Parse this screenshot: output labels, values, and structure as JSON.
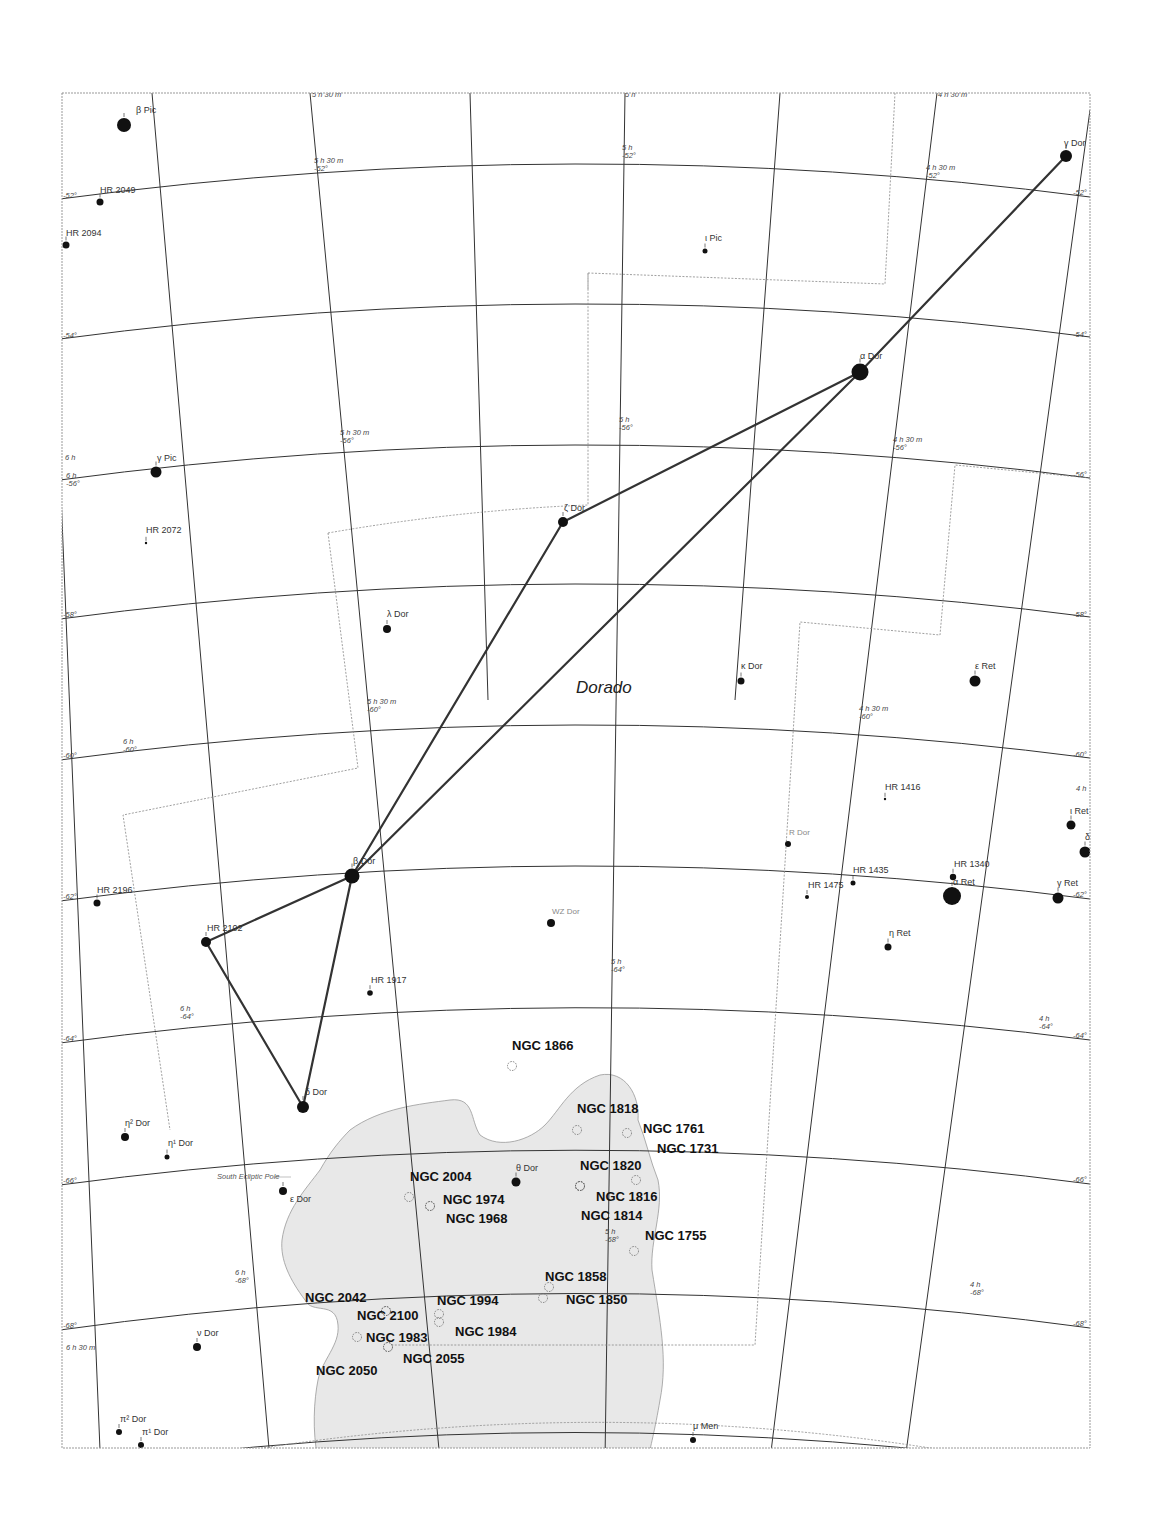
{
  "map": {
    "constellation": "Dorado",
    "special_label": "South Ecliptic Pole",
    "ra_labels": [
      {
        "text": "5 h 30 m",
        "x": 312,
        "y": 97
      },
      {
        "text": "5 h",
        "x": 625,
        "y": 97
      },
      {
        "text": "4 h 30 m",
        "x": 938,
        "y": 97
      },
      {
        "text": "6 h",
        "x": 65,
        "y": 460
      },
      {
        "text": "6 h 30 m",
        "x": 66,
        "y": 1350
      },
      {
        "text": "4 h",
        "x": 1076,
        "y": 791
      }
    ],
    "grid_labels": [
      {
        "ra": "5 h 30 m",
        "dec": "-52°",
        "x": 314,
        "y": 163
      },
      {
        "ra": "5 h",
        "dec": "-52°",
        "x": 622,
        "y": 150
      },
      {
        "ra": "4 h 30 m",
        "dec": "-52°",
        "x": 926,
        "y": 170
      },
      {
        "ra": "5 h 30 m",
        "dec": "-56°",
        "x": 340,
        "y": 435
      },
      {
        "ra": "5 h",
        "dec": "-56°",
        "x": 619,
        "y": 422
      },
      {
        "ra": "4 h 30 m",
        "dec": "-56°",
        "x": 893,
        "y": 442
      },
      {
        "ra": "6 h",
        "dec": "-56°",
        "x": 66,
        "y": 478
      },
      {
        "ra": "5 h 30 m",
        "dec": "-60°",
        "x": 367,
        "y": 704
      },
      {
        "ra": "4 h 30 m",
        "dec": "-60°",
        "x": 859,
        "y": 711
      },
      {
        "ra": "6 h",
        "dec": "-60°",
        "x": 123,
        "y": 744
      },
      {
        "ra": "6 h",
        "dec": "-64°",
        "x": 180,
        "y": 1011
      },
      {
        "ra": "5 h",
        "dec": "-64°",
        "x": 611,
        "y": 964
      },
      {
        "ra": "4 h",
        "dec": "-64°",
        "x": 1039,
        "y": 1021
      },
      {
        "ra": "5 h",
        "dec": "-68°",
        "x": 605,
        "y": 1234
      },
      {
        "ra": "6 h",
        "dec": "-68°",
        "x": 235,
        "y": 1275
      },
      {
        "ra": "4 h",
        "dec": "-68°",
        "x": 970,
        "y": 1287
      }
    ],
    "edge_dec_labels": [
      {
        "text": "-52°",
        "x": 63,
        "y": 198
      },
      {
        "text": "-54°",
        "x": 63,
        "y": 338
      },
      {
        "text": "-58°",
        "x": 63,
        "y": 617
      },
      {
        "text": "-60°",
        "x": 63,
        "y": 758
      },
      {
        "text": "-62°",
        "x": 63,
        "y": 899
      },
      {
        "text": "-64°",
        "x": 63,
        "y": 1041
      },
      {
        "text": "-66°",
        "x": 63,
        "y": 1183
      },
      {
        "text": "-68°",
        "x": 63,
        "y": 1328
      },
      {
        "text": "-52°",
        "x": 1073,
        "y": 195
      },
      {
        "text": "-54°",
        "x": 1073,
        "y": 337
      },
      {
        "text": "-56°",
        "x": 1073,
        "y": 477
      },
      {
        "text": "-58°",
        "x": 1073,
        "y": 617
      },
      {
        "text": "-60°",
        "x": 1073,
        "y": 757
      },
      {
        "text": "-62°",
        "x": 1073,
        "y": 897
      },
      {
        "text": "-64°",
        "x": 1073,
        "y": 1038
      },
      {
        "text": "-66°",
        "x": 1073,
        "y": 1182
      },
      {
        "text": "-68°",
        "x": 1073,
        "y": 1326
      }
    ],
    "stars": [
      {
        "name": "β Pic",
        "x": 124,
        "y": 125,
        "r": 7,
        "lx": 136,
        "ly": 113
      },
      {
        "name": "HR 2049",
        "x": 100,
        "y": 202,
        "r": 3.5,
        "lx": 100,
        "ly": 193
      },
      {
        "name": "HR 2094",
        "x": 66,
        "y": 245,
        "r": 3.5,
        "lx": 66,
        "ly": 236
      },
      {
        "name": "γ Dor",
        "x": 1066,
        "y": 156,
        "r": 6,
        "lx": 1064,
        "ly": 146
      },
      {
        "name": "ι Pic",
        "x": 705,
        "y": 251,
        "r": 2.5,
        "lx": 705,
        "ly": 241
      },
      {
        "name": "α Dor",
        "x": 860,
        "y": 372,
        "r": 8.5,
        "lx": 860,
        "ly": 359
      },
      {
        "name": "γ Pic",
        "x": 156,
        "y": 472,
        "r": 5.5,
        "lx": 157,
        "ly": 461
      },
      {
        "name": "HR 2072",
        "x": 146,
        "y": 543,
        "r": 1.2,
        "lx": 146,
        "ly": 533
      },
      {
        "name": "ζ Dor",
        "x": 563,
        "y": 522,
        "r": 5,
        "lx": 564,
        "ly": 511
      },
      {
        "name": "λ Dor",
        "x": 387,
        "y": 629,
        "r": 4,
        "lx": 387,
        "ly": 617
      },
      {
        "name": "κ Dor",
        "x": 741,
        "y": 681,
        "r": 3.5,
        "lx": 741,
        "ly": 669
      },
      {
        "name": "ε Ret",
        "x": 975,
        "y": 681,
        "r": 5.5,
        "lx": 975,
        "ly": 669
      },
      {
        "name": "HR 1416",
        "x": 885,
        "y": 799,
        "r": 1.2,
        "lx": 885,
        "ly": 790
      },
      {
        "name": "ι Ret",
        "x": 1071,
        "y": 825,
        "r": 4.5,
        "lx": 1070,
        "ly": 814
      },
      {
        "name": "δ Ret",
        "x": 1085,
        "y": 852,
        "r": 5.5,
        "lx": 1085,
        "ly": 840
      },
      {
        "name": "HR 1340",
        "x": 953,
        "y": 877,
        "r": 3.2,
        "lx": 954,
        "ly": 867
      },
      {
        "name": "α Ret",
        "x": 952,
        "y": 896,
        "r": 9,
        "lx": 953,
        "ly": 885
      },
      {
        "name": "HR 1435",
        "x": 853,
        "y": 883,
        "r": 2.5,
        "lx": 853,
        "ly": 873
      },
      {
        "name": "HR 1475",
        "x": 807,
        "y": 897,
        "r": 2,
        "lx": 808,
        "ly": 888
      },
      {
        "name": "γ Ret",
        "x": 1058,
        "y": 898,
        "r": 5.5,
        "lx": 1057,
        "ly": 886
      },
      {
        "name": "η Ret",
        "x": 888,
        "y": 947,
        "r": 3.5,
        "lx": 889,
        "ly": 936
      },
      {
        "name": "β Dor",
        "x": 352,
        "y": 876,
        "r": 7.5,
        "lx": 353,
        "ly": 864
      },
      {
        "name": "HR 2196",
        "x": 97,
        "y": 903,
        "r": 3.5,
        "lx": 97,
        "ly": 893
      },
      {
        "name": "HR 2102",
        "x": 206,
        "y": 942,
        "r": 5,
        "lx": 207,
        "ly": 931
      },
      {
        "name": "HR 1917",
        "x": 370,
        "y": 993,
        "r": 2.8,
        "lx": 371,
        "ly": 983
      },
      {
        "name": "δ Dor",
        "x": 303,
        "y": 1107,
        "r": 6,
        "lx": 305,
        "ly": 1095
      },
      {
        "name": "η² Dor",
        "x": 125,
        "y": 1137,
        "r": 4,
        "lx": 125,
        "ly": 1126
      },
      {
        "name": "η¹ Dor",
        "x": 167,
        "y": 1157,
        "r": 2.5,
        "lx": 168,
        "ly": 1146
      },
      {
        "name": "θ Dor",
        "x": 516,
        "y": 1182,
        "r": 4.5,
        "lx": 516,
        "ly": 1171
      },
      {
        "name": "ε Dor",
        "x": 283,
        "y": 1191,
        "r": 4,
        "lx": 290,
        "ly": 1202
      },
      {
        "name": "ν Dor",
        "x": 197,
        "y": 1347,
        "r": 4,
        "lx": 197,
        "ly": 1336
      },
      {
        "name": "π² Dor",
        "x": 119,
        "y": 1432,
        "r": 3,
        "lx": 120,
        "ly": 1422
      },
      {
        "name": "π¹ Dor",
        "x": 141,
        "y": 1445,
        "r": 3,
        "lx": 142,
        "ly": 1435
      },
      {
        "name": "μ Men",
        "x": 693,
        "y": 1440,
        "r": 3,
        "lx": 693,
        "ly": 1429
      }
    ],
    "variable_stars": [
      {
        "name": "R Dor",
        "x": 788,
        "y": 844,
        "r": 3,
        "lx": 789,
        "ly": 835
      },
      {
        "name": "WZ Dor",
        "x": 551,
        "y": 923,
        "r": 4,
        "lx": 552,
        "ly": 914
      }
    ],
    "deep_sky": [
      {
        "name": "NGC 1866",
        "x": 512,
        "y": 1066,
        "lx": 512,
        "ly": 1050
      },
      {
        "name": "NGC 1818",
        "x": 577,
        "y": 1130,
        "lx": 577,
        "ly": 1113
      },
      {
        "name": "NGC 1761",
        "x": 627,
        "y": 1133,
        "lx": 643,
        "ly": 1133
      },
      {
        "name": "NGC 1731",
        "x": 636,
        "y": 1180,
        "lx": 657,
        "ly": 1153
      },
      {
        "name": "NGC 1820",
        "x": 580,
        "y": 1186,
        "lx": 580,
        "ly": 1170
      },
      {
        "name": "NGC 1816",
        "x": 580,
        "y": 1186,
        "lx": 596,
        "ly": 1201
      },
      {
        "name": "NGC 1814",
        "x": 580,
        "y": 1186,
        "lx": 581,
        "ly": 1220
      },
      {
        "name": "NGC 2004",
        "x": 409,
        "y": 1197,
        "lx": 410,
        "ly": 1181
      },
      {
        "name": "NGC 1974",
        "x": 430,
        "y": 1206,
        "lx": 443,
        "ly": 1204
      },
      {
        "name": "NGC 1968",
        "x": 430,
        "y": 1206,
        "lx": 446,
        "ly": 1223
      },
      {
        "name": "NGC 1755",
        "x": 634,
        "y": 1251,
        "lx": 645,
        "ly": 1240
      },
      {
        "name": "NGC 1858",
        "x": 549,
        "y": 1287,
        "lx": 545,
        "ly": 1281
      },
      {
        "name": "NGC 1850",
        "x": 543,
        "y": 1298,
        "lx": 566,
        "ly": 1304
      },
      {
        "name": "NGC 2042",
        "x": 386,
        "y": 1311,
        "lx": 305,
        "ly": 1302
      },
      {
        "name": "NGC 2100",
        "x": 386,
        "y": 1311,
        "lx": 357,
        "ly": 1320
      },
      {
        "name": "NGC 1994",
        "x": 439,
        "y": 1314,
        "lx": 437,
        "ly": 1305
      },
      {
        "name": "NGC 1984",
        "x": 439,
        "y": 1322,
        "lx": 455,
        "ly": 1336
      },
      {
        "name": "NGC 1983",
        "x": 357,
        "y": 1337,
        "lx": 366,
        "ly": 1342
      },
      {
        "name": "NGC 2055",
        "x": 388,
        "y": 1347,
        "lx": 403,
        "ly": 1363
      },
      {
        "name": "NGC 2050",
        "x": 388,
        "y": 1347,
        "lx": 316,
        "ly": 1375
      }
    ],
    "figure_lines": [
      [
        1066,
        156,
        860,
        372
      ],
      [
        860,
        372,
        563,
        522
      ],
      [
        563,
        522,
        352,
        876
      ],
      [
        860,
        372,
        352,
        876
      ],
      [
        352,
        876,
        206,
        942
      ],
      [
        206,
        942,
        303,
        1107
      ],
      [
        352,
        876,
        303,
        1107
      ]
    ],
    "ecliptic_pole": {
      "x": 283,
      "y": 1177
    }
  }
}
